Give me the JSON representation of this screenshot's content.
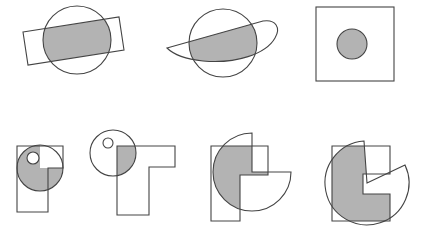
{
  "diagram": {
    "canvas": {
      "width": 427,
      "height": 230,
      "background": "#ffffff"
    },
    "style": {
      "stroke_color": "#444444",
      "stroke_width": 1.1,
      "fill_gray": "#b3b3b3",
      "fill_white": "#ffffff"
    },
    "rows": [
      {
        "name": "top-row",
        "figures": [
          {
            "id": "figure-1",
            "name": "circle-rectangle-overlap",
            "description": "Tilted rectangle crossing a circle, intersection shaded gray",
            "parts": [
              {
                "name": "circle",
                "type": "circle",
                "cx": 77,
                "cy": 40,
                "r": 34,
                "fill": "none"
              },
              {
                "name": "tilted-rectangle",
                "type": "polygon",
                "points": "23,32 119,17 124,50 28,65",
                "fill": "none"
              },
              {
                "name": "intersection-shaded",
                "type": "clip-intersection",
                "fill": "#b3b3b3"
              }
            ]
          },
          {
            "id": "figure-2",
            "name": "circle-lens-overlap",
            "description": "Circle with a tapered lens/ring crossing it, intersection shaded gray",
            "parts": [
              {
                "name": "circle",
                "type": "circle",
                "cx": 223,
                "cy": 43,
                "r": 34,
                "fill": "none"
              },
              {
                "name": "tapered-lens",
                "type": "path",
                "d": "M 167 48 L 263 21 C 276 19 281 28 275 38 C 266 54 236 64 203 61 C 185 59 173 54 167 48 Z",
                "fill": "none"
              },
              {
                "name": "intersection-shaded",
                "type": "clip-intersection",
                "fill": "#b3b3b3"
              }
            ]
          },
          {
            "id": "figure-3",
            "name": "square-with-circle",
            "description": "Square outline containing a fully shaded circle",
            "parts": [
              {
                "name": "square",
                "type": "rect",
                "x": 316,
                "y": 7,
                "width": 78,
                "height": 74,
                "fill": "none"
              },
              {
                "name": "inner-circle",
                "type": "circle",
                "cx": 352,
                "cy": 44,
                "r": 15,
                "fill": "#b3b3b3"
              }
            ]
          }
        ]
      },
      {
        "name": "bottom-row",
        "figures": [
          {
            "id": "figure-4",
            "name": "l-polygon-circle-overlap",
            "description": "L-shaped polygon with a circle; circle shaded except lower-right quadrant, small white circle inside",
            "parts": [
              {
                "name": "l-polygon",
                "type": "polygon",
                "points": "17,146 63,146 63,168 48,168 48,212 17,212",
                "fill": "none"
              },
              {
                "name": "circle",
                "type": "circle",
                "cx": 40,
                "cy": 168,
                "r": 23,
                "fill": "none"
              },
              {
                "name": "shaded-three-quarter",
                "type": "pac-sector",
                "fill": "#b3b3b3"
              },
              {
                "name": "small-hole-circle",
                "type": "circle",
                "cx": 33,
                "cy": 158,
                "r": 6,
                "fill": "#ffffff"
              }
            ]
          },
          {
            "id": "figure-5",
            "name": "t-polygon-circle-overlap",
            "description": "T-shaped polygon with a circle at upper-left; only the overlap corner shaded gray",
            "parts": [
              {
                "name": "t-polygon",
                "type": "polygon",
                "points": "117,146 175,146 175,167 149,167 149,215 117,215",
                "fill": "none"
              },
              {
                "name": "circle",
                "type": "circle",
                "cx": 113,
                "cy": 153,
                "r": 23,
                "fill": "none"
              },
              {
                "name": "small-hole-circle",
                "type": "circle",
                "cx": 108,
                "cy": 143,
                "r": 5,
                "fill": "#ffffff"
              },
              {
                "name": "intersection-shaded",
                "type": "clip-intersection",
                "fill": "#b3b3b3"
              }
            ]
          },
          {
            "id": "figure-6",
            "name": "reverse-l-pacman-overlap",
            "description": "Reverse-L polygon and a pac-man sector; intersection shaded gray",
            "parts": [
              {
                "name": "reverse-l-polygon",
                "type": "polygon",
                "points": "211,146 268,146 268,175 240,175 240,221 211,221",
                "fill": "none"
              },
              {
                "name": "pacman-sector",
                "type": "path",
                "d": "M 252 172 L 252 133 A 39 39 0 1 0 291 172 Z",
                "fill": "none"
              },
              {
                "name": "intersection-shaded",
                "type": "clip-intersection",
                "fill": "#b3b3b3"
              }
            ]
          },
          {
            "id": "figure-7",
            "name": "c-polygon-pacman-overlap",
            "description": "C-shaped bracket polygon and a rotated pac-man sector; intersection shaded gray",
            "parts": [
              {
                "name": "c-polygon",
                "type": "polygon",
                "points": "332,146 390,146 390,174 363,174 363,194 390,194 390,221 332,221",
                "fill": "none"
              },
              {
                "name": "pacman-sector",
                "type": "path",
                "d": "M 367 183 L 405 165 A 42 42 0 1 1 364 141 Z",
                "fill": "none"
              },
              {
                "name": "intersection-shaded",
                "type": "clip-intersection",
                "fill": "#b3b3b3"
              }
            ]
          }
        ]
      }
    ]
  }
}
